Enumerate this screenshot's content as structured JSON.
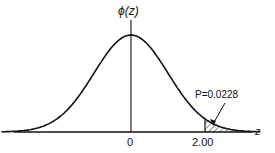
{
  "chart_data": {
    "type": "line",
    "title": "",
    "ylabel": "ϕ(z)",
    "xlabel": "z",
    "x_ticks": [
      {
        "value": 0,
        "label": "0"
      },
      {
        "value": 2.0,
        "label": "2.00"
      }
    ],
    "series": [
      {
        "name": "Standard normal density ϕ(z)",
        "function": "standard_normal_pdf",
        "x_range": [
          -3.5,
          3.5
        ]
      }
    ],
    "shaded_region": {
      "from": 2.0,
      "to": 3.5,
      "pattern": "hatched"
    },
    "annotations": [
      {
        "text": "P=0.0228",
        "points_to": "shaded tail area z > 2.00"
      }
    ],
    "grid": false
  }
}
